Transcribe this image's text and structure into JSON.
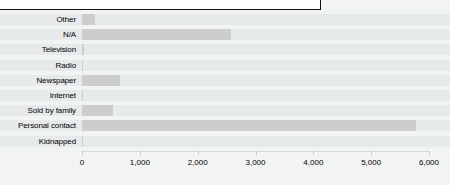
{
  "legend_box": {
    "text": ""
  },
  "chart_data": {
    "type": "bar",
    "orientation": "horizontal",
    "title": "",
    "subtitle": "",
    "xlabel": "",
    "ylabel": "",
    "categories": [
      "Other",
      "N/A",
      "Television",
      "Radio",
      "Newspaper",
      "Internet",
      "Sold by family",
      "Personal contact",
      "Kidnapped"
    ],
    "values": [
      230,
      2580,
      30,
      10,
      660,
      15,
      540,
      5780,
      10
    ],
    "xlim": [
      0,
      6000
    ],
    "xticks": [
      0,
      1000,
      2000,
      3000,
      4000,
      5000,
      6000
    ],
    "xtick_labels": [
      "0",
      "1,000",
      "2,000",
      "3,000",
      "4,000",
      "5,000",
      "6,000"
    ],
    "grid": false,
    "legend": false,
    "bar_color": "#cccdcd",
    "row_band_color": "#e7eaea",
    "background_color": "#f2f3f3"
  }
}
